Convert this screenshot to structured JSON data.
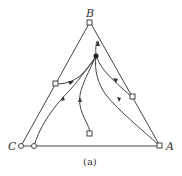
{
  "diagram": {
    "type": "ternary-residue-curve-map",
    "vertices": {
      "A": {
        "label": "A",
        "x": 160,
        "y": 146
      },
      "B": {
        "label": "B",
        "x": 90,
        "y": 22
      },
      "C": {
        "label": "C",
        "x": 21,
        "y": 146
      }
    },
    "caption": "(a)",
    "nodes": [
      {
        "id": "B",
        "shape": "square"
      },
      {
        "id": "A",
        "shape": "square"
      },
      {
        "id": "C",
        "shape": "circle"
      },
      {
        "id": "BC-edge-point",
        "shape": "square"
      },
      {
        "id": "AB-edge-point",
        "shape": "square"
      },
      {
        "id": "AC-edge-point",
        "shape": "circle"
      },
      {
        "id": "interior-point",
        "shape": "square"
      },
      {
        "id": "saddle-point",
        "shape": "filled-circle"
      }
    ]
  }
}
